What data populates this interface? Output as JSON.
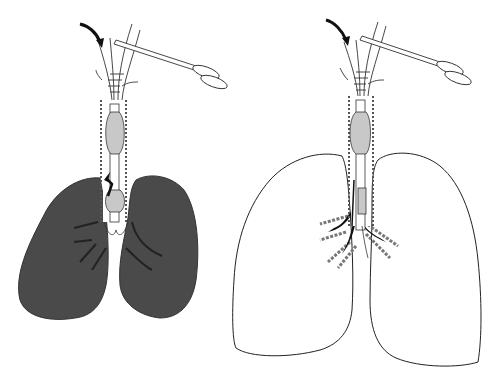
{
  "figure": {
    "type": "medical-illustration",
    "panels": [
      {
        "id": "left",
        "description": "Trachea with inflated cuff/tube and clamp; collapsed (dark) lungs",
        "lung_state": "collapsed",
        "lung_fill": "#4a4a4a"
      },
      {
        "id": "right",
        "description": "Trachea with tube advanced into bronchus; inflated (outline) lungs",
        "lung_state": "inflated",
        "lung_fill": "#ffffff"
      }
    ],
    "colors": {
      "line": "#222222",
      "cuff_fill": "#c8c8c8",
      "collapsed_lung": "#4a4a4a",
      "background": "#ffffff"
    }
  }
}
